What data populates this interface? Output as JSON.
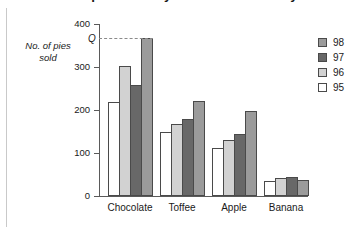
{
  "chart_data": {
    "type": "bar",
    "title": "Number of pies sold by flavour over four years",
    "xlabel": "",
    "ylabel": "No. of pies sold",
    "categories": [
      "Chocolate",
      "Toffee",
      "Apple",
      "Banana"
    ],
    "series": [
      {
        "name": "95",
        "values": [
          218,
          148,
          112,
          35
        ],
        "color": "#ffffff"
      },
      {
        "name": "96",
        "values": [
          303,
          167,
          131,
          43
        ],
        "color": "#d2d2d2"
      },
      {
        "name": "97",
        "values": [
          258,
          178,
          145,
          45
        ],
        "color": "#686868"
      },
      {
        "name": "98",
        "values": [
          368,
          221,
          198,
          37
        ],
        "color": "#9b9b9b"
      }
    ],
    "ylim": [
      0,
      400
    ],
    "y_ticks": [
      0,
      100,
      200,
      300,
      400
    ],
    "grid": false,
    "legend_position": "right",
    "legend_order": [
      "98",
      "97",
      "96",
      "95"
    ],
    "annotations": [
      {
        "label": "Q",
        "value": 368,
        "style": "dashed-leader-to-bar"
      }
    ]
  },
  "axis": {
    "y_caption_line1": "No. of pies",
    "y_caption_line2": "sold",
    "q_label": "Q"
  }
}
